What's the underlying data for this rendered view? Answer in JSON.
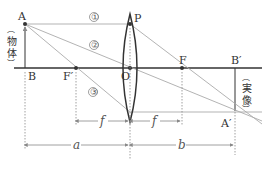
{
  "diagram": {
    "type": "convex-lens-ray-diagram",
    "points": {
      "A": "A",
      "B": "B",
      "F_prime": "F′",
      "O": "O",
      "F": "F",
      "B_prime": "B′",
      "A_prime": "A′",
      "P": "P"
    },
    "rays": [
      "①",
      "②",
      "③"
    ],
    "object_label": "物体",
    "image_label": "実像",
    "distances": {
      "f": "f",
      "a": "a",
      "b": "b"
    },
    "colors": {
      "axis": "#333333",
      "ray": "#aaaaaa",
      "lens": "#333333",
      "guide": "#888888"
    }
  }
}
